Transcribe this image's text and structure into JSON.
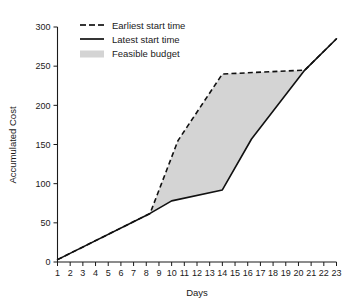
{
  "chart_data": {
    "type": "area",
    "title": "",
    "xlabel": "Days",
    "ylabel": "Accumulated Cost",
    "xlim": [
      1,
      23
    ],
    "ylim": [
      0,
      300
    ],
    "grid": false,
    "legend_position": "top-left",
    "x_ticks": [
      1,
      2,
      3,
      4,
      5,
      6,
      7,
      8,
      9,
      10,
      11,
      12,
      13,
      14,
      15,
      16,
      17,
      18,
      19,
      20,
      21,
      22,
      23
    ],
    "y_ticks": [
      0,
      50,
      100,
      150,
      200,
      250,
      300
    ],
    "colors": {
      "band": "#d4d4d4",
      "line": "#111111",
      "axis": "#1a1a1a",
      "background": "#ffffff"
    },
    "series": [
      {
        "name": "Earliest start time",
        "style": "dashed",
        "points": [
          [
            1,
            3
          ],
          [
            8.3,
            62
          ],
          [
            10.5,
            155
          ],
          [
            14,
            240
          ],
          [
            20.5,
            245
          ],
          [
            23,
            285
          ]
        ]
      },
      {
        "name": "Latest start time",
        "style": "solid",
        "points": [
          [
            1,
            3
          ],
          [
            8.3,
            62
          ],
          [
            10,
            78
          ],
          [
            14,
            92
          ],
          [
            16.3,
            157
          ],
          [
            20.5,
            245
          ],
          [
            23,
            285
          ]
        ]
      }
    ],
    "band": {
      "name": "Feasible budget",
      "upper_series": "Earliest start time",
      "lower_series": "Latest start time",
      "x_start": 8.3,
      "x_end": 20.5
    }
  },
  "legend": {
    "items": [
      {
        "label": "Earliest start time",
        "marker": "dashed-line"
      },
      {
        "label": "Latest start time",
        "marker": "solid-line"
      },
      {
        "label": "Feasible budget",
        "marker": "gray-swatch"
      }
    ]
  },
  "axes": {
    "x_title": "Days",
    "y_title": "Accumulated Cost"
  }
}
